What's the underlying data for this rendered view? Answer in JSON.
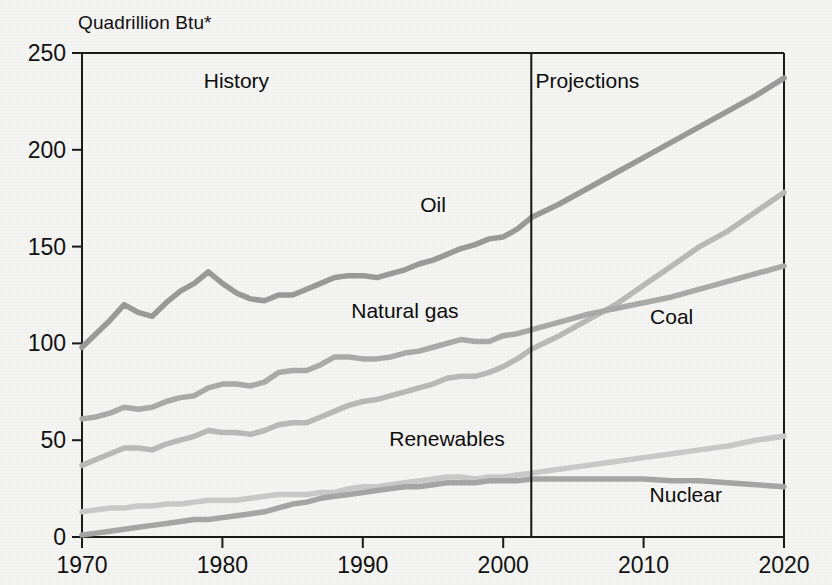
{
  "chart_data": {
    "type": "line",
    "title": "",
    "unit_note": "Quadrillion Btu*",
    "xlabel": "",
    "ylabel": "Quadrillion Btu*",
    "xlim": [
      1970,
      2020
    ],
    "ylim": [
      0,
      250
    ],
    "grid": false,
    "legend": "inline-annotations",
    "x_ticks": [
      "1970",
      "1980",
      "1990",
      "2000",
      "2010",
      "2020"
    ],
    "y_ticks": [
      "0",
      "50",
      "100",
      "150",
      "200",
      "250"
    ],
    "annotations": [
      {
        "name": "history-label",
        "text": "History",
        "x": 1981,
        "y": 232
      },
      {
        "name": "projections-label",
        "text": "Projections",
        "x": 2006,
        "y": 232
      },
      {
        "name": "divider-note",
        "text": "",
        "x": 2002,
        "y": 0
      }
    ],
    "divider_year": 2002,
    "x": [
      1970,
      1971,
      1972,
      1973,
      1974,
      1975,
      1976,
      1977,
      1978,
      1979,
      1980,
      1981,
      1982,
      1983,
      1984,
      1985,
      1986,
      1987,
      1988,
      1989,
      1990,
      1991,
      1992,
      1993,
      1994,
      1995,
      1996,
      1997,
      1998,
      1999,
      2000,
      2001,
      2002,
      2004,
      2006,
      2008,
      2010,
      2012,
      2014,
      2016,
      2018,
      2020
    ],
    "series": [
      {
        "name": "Oil",
        "label": "Oil",
        "color": "#9a9a9a",
        "label_x": 1995,
        "label_y": 168,
        "values": [
          98,
          105,
          112,
          120,
          116,
          114,
          121,
          127,
          131,
          137,
          131,
          126,
          123,
          122,
          125,
          125,
          128,
          131,
          134,
          135,
          135,
          134,
          136,
          138,
          141,
          143,
          146,
          149,
          151,
          154,
          155,
          159,
          165,
          172,
          180,
          188,
          196,
          204,
          212,
          220,
          228,
          237
        ]
      },
      {
        "name": "Natural gas",
        "label": "Natural gas",
        "color": "#b9b9b9",
        "label_x": 1993,
        "label_y": 113,
        "values": [
          37,
          40,
          43,
          46,
          46,
          45,
          48,
          50,
          52,
          55,
          54,
          54,
          53,
          55,
          58,
          59,
          59,
          62,
          65,
          68,
          70,
          71,
          73,
          75,
          77,
          79,
          82,
          83,
          83,
          85,
          88,
          92,
          97,
          104,
          112,
          120,
          130,
          140,
          150,
          158,
          168,
          178
        ]
      },
      {
        "name": "Coal",
        "label": "Coal",
        "color": "#aaaaaa",
        "label_x": 2012,
        "label_y": 110,
        "values": [
          61,
          62,
          64,
          67,
          66,
          67,
          70,
          72,
          73,
          77,
          79,
          79,
          78,
          80,
          85,
          86,
          86,
          89,
          93,
          93,
          92,
          92,
          93,
          95,
          96,
          98,
          100,
          102,
          101,
          101,
          104,
          105,
          107,
          111,
          115,
          118,
          121,
          124,
          128,
          132,
          136,
          140
        ]
      },
      {
        "name": "Renewables",
        "label": "Renewables",
        "color": "#c9c9c9",
        "label_x": 1996,
        "label_y": 47,
        "values": [
          13,
          14,
          15,
          15,
          16,
          16,
          17,
          17,
          18,
          19,
          19,
          19,
          20,
          21,
          22,
          22,
          22,
          23,
          23,
          25,
          26,
          26,
          27,
          28,
          29,
          30,
          31,
          31,
          30,
          31,
          31,
          32,
          33,
          35,
          37,
          39,
          41,
          43,
          45,
          47,
          50,
          52
        ]
      },
      {
        "name": "Nuclear",
        "label": "Nuclear",
        "color": "#a6a6a6",
        "label_x": 2013,
        "label_y": 18,
        "values": [
          1,
          2,
          3,
          4,
          5,
          6,
          7,
          8,
          9,
          9,
          10,
          11,
          12,
          13,
          15,
          17,
          18,
          20,
          21,
          22,
          23,
          24,
          25,
          26,
          26,
          27,
          28,
          28,
          28,
          29,
          29,
          29,
          30,
          30,
          30,
          30,
          30,
          29,
          29,
          28,
          27,
          26
        ]
      }
    ]
  },
  "axes": {
    "unit_text": "Quadrillion Btu*"
  }
}
